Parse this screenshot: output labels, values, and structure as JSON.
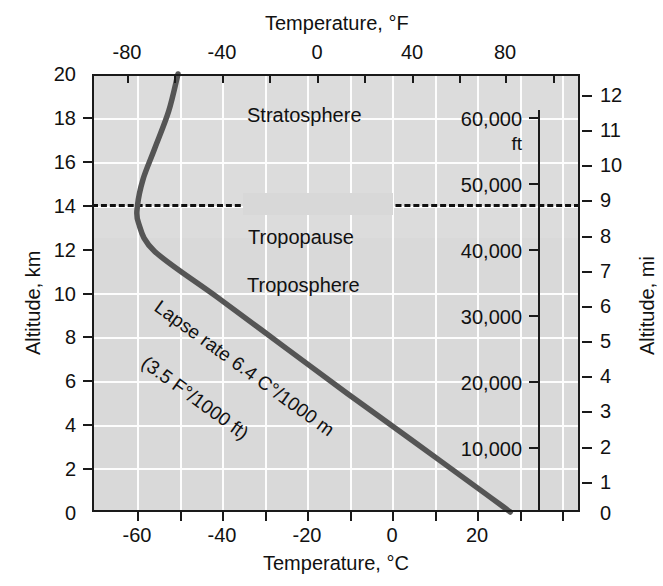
{
  "chart_data": {
    "type": "line",
    "title": "",
    "xlabel": "Temperature, °C",
    "xlabel_top": "Temperature, °F",
    "ylabel": "Altitude, km",
    "ylabel_right": "Altitude, mi",
    "xlim": [
      -70,
      35
    ],
    "ylim": [
      0,
      20
    ],
    "grid": true,
    "legend": "none",
    "xticks_c": [
      "-60",
      "-40",
      "-20",
      "0",
      "20"
    ],
    "xticks_c_values": [
      -60,
      -40,
      -20,
      0,
      20
    ],
    "xticks_f": [
      "-80",
      "-40",
      "0",
      "40",
      "80"
    ],
    "xticks_f_values": [
      -80,
      -40,
      0,
      40,
      80
    ],
    "yticks_km": [
      "20",
      "18",
      "16",
      "14",
      "12",
      "10",
      "8",
      "6",
      "4",
      "2",
      "0"
    ],
    "yticks_km_values": [
      20,
      18,
      16,
      14,
      12,
      10,
      8,
      6,
      4,
      2,
      0
    ],
    "yticks_mi": [
      "12",
      "11",
      "10",
      "9",
      "8",
      "7",
      "6",
      "5",
      "4",
      "3",
      "2",
      "1",
      "0"
    ],
    "yticks_mi_values": [
      12,
      11,
      10,
      9,
      8,
      7,
      6,
      5,
      4,
      3,
      2,
      1,
      0
    ],
    "yticks_ft_labels": [
      "60,000",
      "50,000",
      "40,000",
      "30,000",
      "20,000",
      "10,000"
    ],
    "yticks_ft_values": [
      60000,
      50000,
      40000,
      30000,
      20000,
      10000
    ],
    "ft_unit_label": "ft",
    "series": [
      {
        "name": "Standard atmosphere temperature profile",
        "x": [
          20,
          13.6,
          -1.3,
          -15,
          -29,
          -43,
          -56.5,
          -60,
          -60.2,
          -59,
          -56.5,
          -53.5,
          -51.5
        ],
        "y": [
          0,
          1,
          3.3,
          5.4,
          7.6,
          9.8,
          11.9,
          13.2,
          14.0,
          15.2,
          16.6,
          18.3,
          20.0
        ],
        "units_x": "°C",
        "units_y": "km"
      }
    ],
    "annotations": [
      {
        "name": "stratosphere",
        "text": "Stratosphere",
        "x_c": -20,
        "y_km": 17.7
      },
      {
        "name": "tropopause",
        "text": "Tropopause",
        "x_c": -27,
        "y_km": 14.0
      },
      {
        "name": "troposphere",
        "text": "Troposphere",
        "x_c": -23,
        "y_km": 11.6
      },
      {
        "name": "lapse-rate-line-1",
        "text": "Lapse rate 6.4 C°/1000 m",
        "x_c": -45,
        "y_km": 9.6
      },
      {
        "name": "lapse-rate-line-2",
        "text": "(3.5 F°/1000 ft)",
        "x_c": -44,
        "y_km": 7.2
      }
    ],
    "tropopause_altitude_km": 14.0,
    "tropopause_altitude_mi": 9,
    "tropopause_altitude_ft": 46000,
    "surface_temperature_c": 20,
    "lapse_rate_c_per_1000m": 6.4,
    "lapse_rate_f_per_1000ft": 3.5
  },
  "colors": {
    "plot_background": "#d9d9d9",
    "upper_background": "#dcdcdc",
    "gridline": "#fdfdfd",
    "axis": "#1a1a1a",
    "curve": "#555555",
    "text": "#111111"
  }
}
